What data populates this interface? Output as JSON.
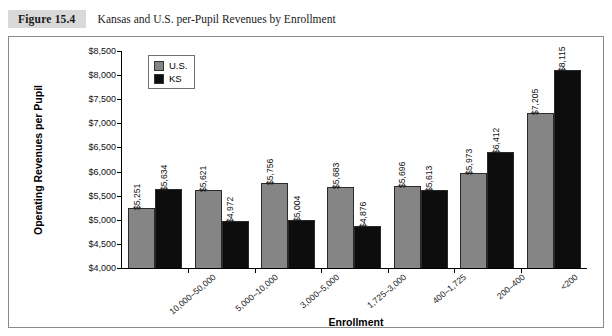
{
  "figure": {
    "tag": "Figure 15.4",
    "title": "Kansas and U.S. per-Pupil Revenues by Enrollment"
  },
  "legend": {
    "position": "top-left-inside",
    "items": [
      {
        "label": "U.S.",
        "color": "#858585",
        "icon": "legend-swatch-us"
      },
      {
        "label": "KS",
        "color": "#0d0d0d",
        "icon": "legend-swatch-ks"
      }
    ]
  },
  "axes": {
    "ylabel": "Operating Revenues per Pupil",
    "xlabel": "Enrollment",
    "yticks": [
      "$8,500",
      "$8,000",
      "$7,500",
      "$7,000",
      "$6,500",
      "$6,000",
      "$5,500",
      "$5,000",
      "$4,500",
      "$4,000"
    ]
  },
  "chart_data": {
    "type": "bar",
    "title": "Kansas and U.S. per-Pupil Revenues by Enrollment",
    "xlabel": "Enrollment",
    "ylabel": "Operating Revenues per Pupil",
    "ylim": [
      4000,
      8500
    ],
    "ytick_step": 500,
    "grid": false,
    "legend_position": "top-left-inside",
    "categories": [
      "10,000–50,000",
      "5,000–10,000",
      "3,000–5,000",
      "1,725–3,000",
      "400–1,725",
      "200–400",
      "<200"
    ],
    "series": [
      {
        "name": "U.S.",
        "color": "#858585",
        "values": [
          5251,
          5621,
          5756,
          5683,
          5696,
          5973,
          7205
        ],
        "labels": [
          "$5,251",
          "$5,621",
          "$5,756",
          "$5,683",
          "$5,696",
          "$5,973",
          "$7,205"
        ]
      },
      {
        "name": "KS",
        "color": "#0d0d0d",
        "values": [
          5634,
          4972,
          5004,
          4876,
          5613,
          6412,
          8115
        ],
        "labels": [
          "$5,634",
          "$4,972",
          "$5,004",
          "$4,876",
          "$5,613",
          "$6,412",
          "$8,115"
        ]
      }
    ]
  }
}
